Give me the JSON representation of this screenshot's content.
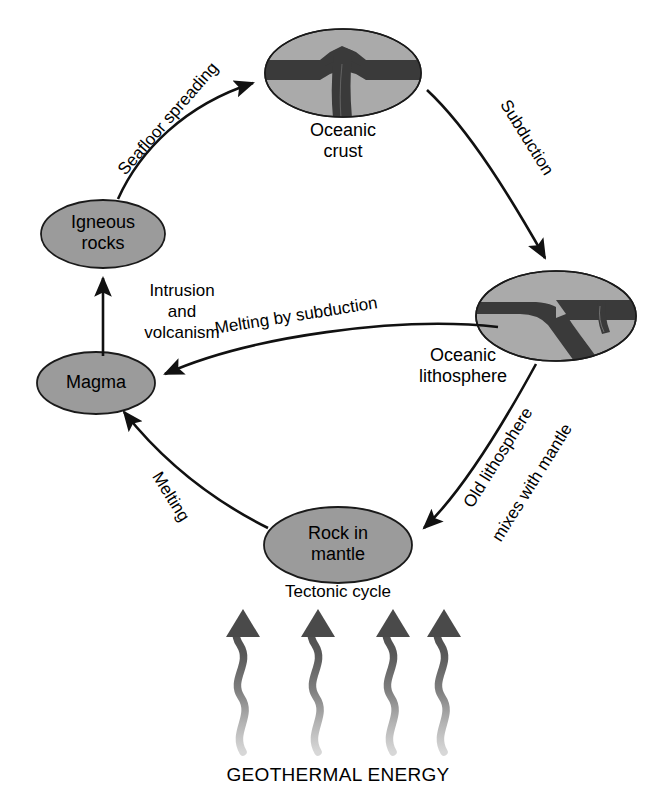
{
  "diagram": {
    "title": "Tectonic cycle",
    "caption": "GEOTHERMAL ENERGY",
    "nodes": [
      {
        "id": "oceanic-crust",
        "label_line1": "Oceanic",
        "label_line2": "crust",
        "kind": "inset-ellipse"
      },
      {
        "id": "oceanic-lithosphere",
        "label_line1": "Oceanic",
        "label_line2": "lithosphere",
        "kind": "inset-ellipse"
      },
      {
        "id": "igneous-rocks",
        "label_line1": "Igneous",
        "label_line2": "rocks",
        "kind": "ellipse"
      },
      {
        "id": "magma",
        "label_line1": "Magma",
        "label_line2": "",
        "kind": "ellipse"
      },
      {
        "id": "rock-in-mantle",
        "label_line1": "Rock in",
        "label_line2": "mantle",
        "kind": "ellipse"
      }
    ],
    "arrows": [
      {
        "id": "seafloor-spreading",
        "label": "Seafloor spreading",
        "from": "igneous-rocks",
        "to": "oceanic-crust"
      },
      {
        "id": "subduction",
        "label": "Subduction",
        "from": "oceanic-crust",
        "to": "oceanic-lithosphere"
      },
      {
        "id": "melting-by-subduction",
        "label": "Melting by subduction",
        "from": "oceanic-lithosphere",
        "to": "magma"
      },
      {
        "id": "intrusion-and-volcanism",
        "label_line1": "Intrusion",
        "label_line2": "and",
        "label_line3": "volcanism",
        "from": "magma",
        "to": "igneous-rocks"
      },
      {
        "id": "old-lithosphere-mixes",
        "label_line1": "Old lithosphere",
        "label_line2": "mixes with mantle",
        "from": "oceanic-lithosphere",
        "to": "rock-in-mantle"
      },
      {
        "id": "melting",
        "label": "Melting",
        "from": "rock-in-mantle",
        "to": "magma"
      }
    ],
    "energy_arrows_count": 4,
    "colors": {
      "ellipse_fill": "#9b9b9b",
      "inset_fill": "#aaaaaa",
      "crust_dark": "#3a3a3a",
      "outline": "#1a1a1a",
      "text": "#000000",
      "background": "#ffffff"
    }
  }
}
